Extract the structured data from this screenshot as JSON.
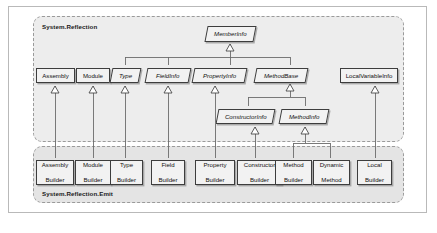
{
  "figure": {
    "caption": ""
  },
  "packages": [
    {
      "id": "reflection",
      "label": "System.Reflection"
    },
    {
      "id": "emit",
      "label": "System.Reflection.Emit"
    }
  ],
  "classes": {
    "member_info": {
      "label": "MemberInfo",
      "abstract": true
    },
    "assembly": {
      "label": "Assembly",
      "abstract": false
    },
    "module": {
      "label": "Module",
      "abstract": false
    },
    "type": {
      "label": "Type",
      "abstract": true
    },
    "field_info": {
      "label": "FieldInfo",
      "abstract": true
    },
    "property_info": {
      "label": "PropertyInfo",
      "abstract": true
    },
    "method_base": {
      "label": "MethodBase",
      "abstract": true
    },
    "local_variable_info": {
      "label": "LocalVariableInfo",
      "abstract": false
    },
    "constructor_info": {
      "label": "ConstructorInfo",
      "abstract": true
    },
    "method_info": {
      "label": "MethodInfo",
      "abstract": true
    },
    "assembly_builder": {
      "label": "Assembly\nBuilder",
      "line1": "Assembly",
      "line2": "Builder"
    },
    "module_builder": {
      "label": "Module\nBuilder",
      "line1": "Module",
      "line2": "Builder"
    },
    "type_builder": {
      "label": "Type\nBuilder",
      "line1": "Type",
      "line2": "Builder"
    },
    "field_builder": {
      "label": "Field\nBuilder",
      "line1": "Field",
      "line2": "Builder"
    },
    "property_builder": {
      "label": "Property\nBuilder",
      "line1": "Property",
      "line2": "Builder"
    },
    "constructor_builder": {
      "label": "Constructor\nBuilder",
      "line1": "Constructor",
      "line2": "Builder"
    },
    "method_builder": {
      "label": "Method\nBuilder",
      "line1": "Method",
      "line2": "Builder"
    },
    "dynamic_method": {
      "label": "Dynamic\nMethod",
      "line1": "Dynamic",
      "line2": "Method"
    },
    "local_builder": {
      "label": "Local\nBuilder",
      "line1": "Local",
      "line2": "Builder"
    }
  },
  "inheritance": [
    {
      "from": "type",
      "to": "member_info"
    },
    {
      "from": "field_info",
      "to": "member_info"
    },
    {
      "from": "property_info",
      "to": "member_info"
    },
    {
      "from": "method_base",
      "to": "member_info"
    },
    {
      "from": "constructor_info",
      "to": "method_base"
    },
    {
      "from": "method_info",
      "to": "method_base"
    },
    {
      "from": "assembly_builder",
      "to": "assembly"
    },
    {
      "from": "module_builder",
      "to": "module"
    },
    {
      "from": "type_builder",
      "to": "type"
    },
    {
      "from": "field_builder",
      "to": "field_info"
    },
    {
      "from": "property_builder",
      "to": "property_info"
    },
    {
      "from": "constructor_builder",
      "to": "constructor_info"
    },
    {
      "from": "method_builder",
      "to": "method_info"
    },
    {
      "from": "dynamic_method",
      "to": "method_info"
    },
    {
      "from": "local_builder",
      "to": "local_variable_info"
    }
  ],
  "colors": {
    "page_background": "#ffffff",
    "package_fill": "#ededed",
    "package_fill_emit": "#e4e4e4",
    "package_border": "#9a9a9a",
    "class_fill": "#f2f2f2",
    "class_border": "#3d3d3d",
    "connector": "#6b6b6b",
    "text": "#111111"
  }
}
